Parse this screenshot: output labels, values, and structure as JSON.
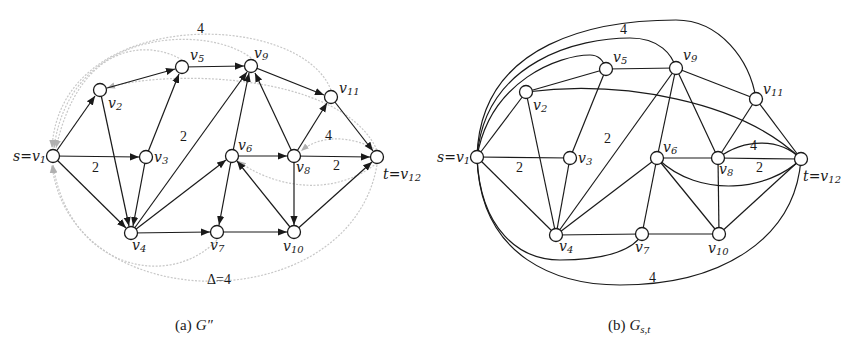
{
  "figure_a": {
    "caption_prefix": "(a)",
    "caption_graph": "G″",
    "nodes": {
      "v1": {
        "label": "s=v",
        "sub": "1"
      },
      "v2": {
        "label": "v",
        "sub": "2"
      },
      "v3": {
        "label": "v",
        "sub": "3"
      },
      "v4": {
        "label": "v",
        "sub": "4"
      },
      "v5": {
        "label": "v",
        "sub": "5"
      },
      "v6": {
        "label": "v",
        "sub": "6"
      },
      "v7": {
        "label": "v",
        "sub": "7"
      },
      "v8": {
        "label": "v",
        "sub": "8"
      },
      "v9": {
        "label": "v",
        "sub": "9"
      },
      "v10": {
        "label": "v",
        "sub": "10"
      },
      "v11": {
        "label": "v",
        "sub": "11"
      },
      "v12": {
        "label": "t=v",
        "sub": "12"
      }
    },
    "edges": [
      [
        "v1",
        "v2"
      ],
      [
        "v1",
        "v3"
      ],
      [
        "v1",
        "v4"
      ],
      [
        "v2",
        "v5"
      ],
      [
        "v2",
        "v4"
      ],
      [
        "v3",
        "v5"
      ],
      [
        "v3",
        "v4"
      ],
      [
        "v4",
        "v9"
      ],
      [
        "v4",
        "v6"
      ],
      [
        "v4",
        "v7"
      ],
      [
        "v5",
        "v9"
      ],
      [
        "v6",
        "v9"
      ],
      [
        "v6",
        "v8"
      ],
      [
        "v6",
        "v7"
      ],
      [
        "v7",
        "v10"
      ],
      [
        "v8",
        "v9"
      ],
      [
        "v8",
        "v11"
      ],
      [
        "v8",
        "v12"
      ],
      [
        "v8",
        "v10"
      ],
      [
        "v10",
        "v6"
      ],
      [
        "v10",
        "v12"
      ],
      [
        "v9",
        "v11"
      ],
      [
        "v11",
        "v12"
      ]
    ],
    "weights": {
      "v1_v3": "2",
      "v4_v9": "2",
      "v8_v12": "2",
      "top_arc": "4",
      "v12_v8_arc": "4"
    },
    "delta_label": "Δ=4",
    "colors": {
      "edge": "#1a1a1a",
      "backward_arc": "#c8c8c8"
    }
  },
  "figure_b": {
    "caption_prefix": "(b)",
    "caption_graph": "G",
    "caption_subscript": "s,t",
    "nodes": {
      "v1": {
        "label": "s=v",
        "sub": "1"
      },
      "v2": {
        "label": "v",
        "sub": "2"
      },
      "v3": {
        "label": "v",
        "sub": "3"
      },
      "v4": {
        "label": "v",
        "sub": "4"
      },
      "v5": {
        "label": "v",
        "sub": "5"
      },
      "v6": {
        "label": "v",
        "sub": "6"
      },
      "v7": {
        "label": "v",
        "sub": "7"
      },
      "v8": {
        "label": "v",
        "sub": "8"
      },
      "v9": {
        "label": "v",
        "sub": "9"
      },
      "v10": {
        "label": "v",
        "sub": "10"
      },
      "v11": {
        "label": "v",
        "sub": "11"
      },
      "v12": {
        "label": "t=v",
        "sub": "12"
      }
    },
    "weights": {
      "v1_v3": "2",
      "v4_v9": "2",
      "top_arc": "4",
      "v8_v12_arc": "4",
      "v8_v12": "2",
      "bottom_arc": "4"
    }
  }
}
